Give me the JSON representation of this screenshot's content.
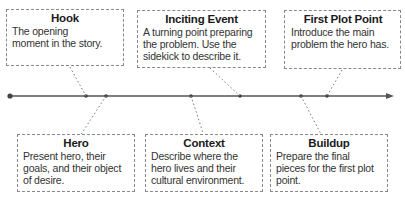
{
  "diagram": {
    "type": "story-timeline",
    "colors": {
      "line": "#555555",
      "box_border": "#888888",
      "text": "#222222"
    },
    "events": [
      {
        "id": "hook",
        "title": "Hook",
        "description": "The opening moment in the story.",
        "position": "top"
      },
      {
        "id": "hero",
        "title": "Hero",
        "description": "Present hero, their goals, and their object of desire.",
        "position": "bottom"
      },
      {
        "id": "context",
        "title": "Context",
        "description": "Describe where the hero lives and their cultural environment.",
        "position": "bottom"
      },
      {
        "id": "inciting-event",
        "title": "Inciting Event",
        "description": "A turning point preparing the problem. Use the sidekick to describe it.",
        "position": "top"
      },
      {
        "id": "buildup",
        "title": "Buildup",
        "description": "Prepare the final pieces for the first plot point.",
        "position": "bottom"
      },
      {
        "id": "first-plot-point",
        "title": "First Plot Point",
        "description": "Introduce the main problem the hero has.",
        "position": "top"
      }
    ]
  }
}
